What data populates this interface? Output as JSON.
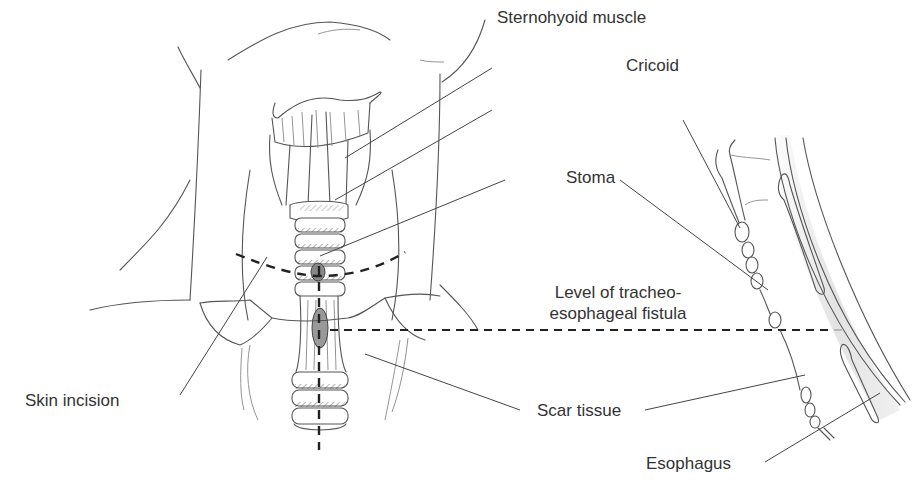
{
  "figure": {
    "views": [
      "anterior-neck-view",
      "sagittal-section-view"
    ]
  },
  "labels": {
    "sternohyoid": "Sternohyoid muscle",
    "cricoid": "Cricoid",
    "stoma": "Stoma",
    "level_line1": "Level of tracheo-",
    "level_line2": "esophageal fistula",
    "skin_incision": "Skin incision",
    "scar_tissue": "Scar tissue",
    "esophagus": "Esophagus"
  },
  "colors": {
    "ink": "#555555",
    "text": "#333333",
    "dash": "#222222",
    "shade": "#dddddd"
  }
}
